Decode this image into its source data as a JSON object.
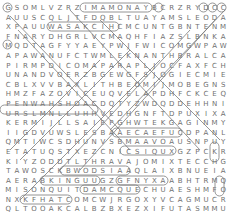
{
  "puzzle": {
    "type": "word-search",
    "rows": [
      "GSOMLVZRZIMAMONAYBCRZRYDCC",
      "AUUSCQLJTFDQBLTUAYAMSLEODA",
      "XPAUUWASAKCIHCMCUNTGBNTENM",
      "FNARYDHGRLVCMAQHFIAZSLBNKA",
      "MQDTAGFYYAEYPWJFWICOMGWPAW",
      "APAWANUFCTWMLEKNANTHBRALCA",
      "PIRMPDICOMAPARAPLJOCFAXFCH",
      "UNANDVOERZBGEWGFSJOGIECMIE",
      "CBLXVVBAXLITHBEOMIJMOBEGNS",
      "HMZFAZOVICEUQVELAPDHFCKCEQ",
      "PENWAHSHOACDQTYZWDQDDEHHNI",
      "URSLMNLLUHHVEDHGNFTDPUXIXA",
      "KERMIJLLSAIEPGHWTEKGAGINMY",
      "IIGDVUWSLESBAAECAEFUCDPANL",
      "QMTIWCSDHUNVSBMAAVOAUSNPUY",
      "ETATUQSTXEZCNICSIQUXGZPCKR",
      "KIYZODDTLTHRAVAJOMIXTECCHG",
      "TAWOSCKBWODSIAAQLAIXBNUEIA",
      "AERABKINGUUGZGFNYXAABHTRMQ",
      "MISONQUITDAMCQUECHUAESHMFO",
      "NXKFHATCOMCWJRGOXYVCAGMUCR",
      "QLTOOAKCALBZBXEZXIFUTASMMU",
      "ZSGNSDDUVTADUJCETFOKCRBGFO"
    ]
  },
  "colors": {
    "background": "#ffffff",
    "letters": "#6f6f6f",
    "outline": "#7a7a7a"
  }
}
